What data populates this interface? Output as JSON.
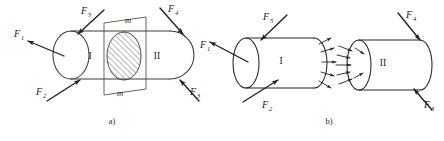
{
  "figure": {
    "captions": [
      {
        "id": "a",
        "text": "a)",
        "x": 112,
        "y": 124
      },
      {
        "id": "b",
        "text": "b)",
        "x": 329,
        "y": 124
      }
    ],
    "section_labels": [
      {
        "text": "m",
        "x": 128,
        "y": 23
      },
      {
        "text": "m",
        "x": 120,
        "y": 96
      }
    ],
    "part_a": {
      "region_labels": [
        {
          "text": "I",
          "x": 90,
          "y": 59
        },
        {
          "text": "II",
          "x": 157,
          "y": 59
        }
      ],
      "forces": [
        {
          "base": "F",
          "sub": "1",
          "label_x": 14,
          "label_y": 37,
          "x1": 64,
          "y1": 56,
          "x2": 28,
          "y2": 41
        },
        {
          "base": "F",
          "sub": "5",
          "label_x": 81,
          "label_y": 14,
          "x1": 104,
          "y1": 10,
          "x2": 78,
          "y2": 34
        },
        {
          "base": "F",
          "sub": "2",
          "label_x": 36,
          "label_y": 95,
          "x1": 47,
          "y1": 101,
          "x2": 80,
          "y2": 80
        },
        {
          "base": "F",
          "sub": "4",
          "label_x": 168,
          "label_y": 12,
          "x1": 160,
          "y1": 8,
          "x2": 183,
          "y2": 34
        },
        {
          "base": "F",
          "sub": "3",
          "label_x": 190,
          "label_y": 95,
          "x1": 199,
          "y1": 101,
          "x2": 180,
          "y2": 80
        }
      ]
    },
    "part_b": {
      "region_labels": [
        {
          "text": "I",
          "x": 281,
          "y": 64
        },
        {
          "text": "II",
          "x": 383,
          "y": 66
        }
      ],
      "forces": [
        {
          "base": "F",
          "sub": "1",
          "label_x": 200,
          "label_y": 48,
          "x1": 248,
          "y1": 62,
          "x2": 210,
          "y2": 42
        },
        {
          "base": "F",
          "sub": "5",
          "label_x": 263,
          "label_y": 20,
          "x1": 287,
          "y1": 15,
          "x2": 261,
          "y2": 40
        },
        {
          "base": "F",
          "sub": "2",
          "label_x": 262,
          "label_y": 104,
          "x1": 243,
          "y1": 102,
          "x2": 278,
          "y2": 80
        },
        {
          "base": "F",
          "sub": "4",
          "label_x": 406,
          "label_y": 18,
          "x1": 398,
          "y1": 13,
          "x2": 420,
          "y2": 40
        },
        {
          "base": "F",
          "sub": "3",
          "label_x": 424,
          "label_y": 104,
          "x1": 432,
          "y1": 110,
          "x2": 414,
          "y2": 89
        }
      ],
      "internal_force_note": "distributed internal forces shown as small arrows on both cut faces"
    },
    "colors": {
      "stroke": "#3a3a3a",
      "arrow": "#1f1f1f",
      "text": "#1a1a1a",
      "caption": "#2a2a2a",
      "background": "#ffffff",
      "hatch": "#555555"
    }
  }
}
